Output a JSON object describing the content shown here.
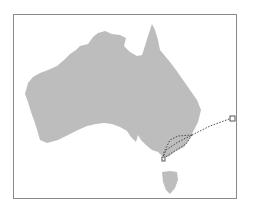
{
  "map": {
    "region": "Australia",
    "land_color": "#bdbdbd",
    "frame_color": "#8a8a8a",
    "route_color": "#4a4a4a",
    "routes": [
      {
        "name": "offshore-route",
        "style": "dotted"
      },
      {
        "name": "inland-route-north",
        "style": "dotted"
      },
      {
        "name": "inland-route-south",
        "style": "dotted"
      }
    ],
    "markers": [
      {
        "name": "offshore-endpoint",
        "shape": "square"
      },
      {
        "name": "mainland-endpoint",
        "shape": "square"
      }
    ]
  }
}
